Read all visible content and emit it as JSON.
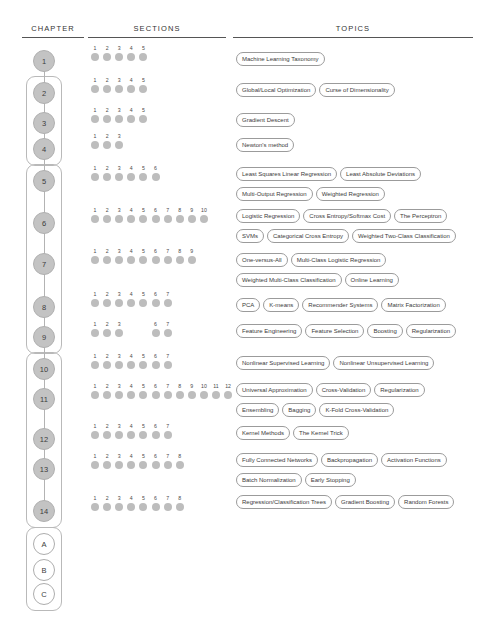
{
  "headers": {
    "chapter": "CHAPTER",
    "sections": "SECTIONS",
    "topics": "TOPICS"
  },
  "colors": {
    "node_fill": "#c3c3c3",
    "node_border": "#b0b0b0",
    "dot": "#bdbdbd",
    "pill_border": "#9b9b9b",
    "group_border": "#b9b9b9",
    "link": "#b3b3b3",
    "text": "#3a3a3a"
  },
  "groups": [
    {
      "name": "group-chapters-2-4",
      "from": 2,
      "to": 4
    },
    {
      "name": "group-chapters-5-9",
      "from": 5,
      "to": 9
    },
    {
      "name": "group-chapters-10-14",
      "from": 10,
      "to": 14
    },
    {
      "name": "group-appendices-a-c",
      "from": "A",
      "to": "C"
    }
  ],
  "chapters": [
    {
      "label": "1",
      "y": 50,
      "appendix": false
    },
    {
      "label": "2",
      "y": 82,
      "appendix": false
    },
    {
      "label": "3",
      "y": 112,
      "appendix": false
    },
    {
      "label": "4",
      "y": 138,
      "appendix": false
    },
    {
      "label": "5",
      "y": 170,
      "appendix": false
    },
    {
      "label": "6",
      "y": 212,
      "appendix": false
    },
    {
      "label": "7",
      "y": 253,
      "appendix": false
    },
    {
      "label": "8",
      "y": 296,
      "appendix": false
    },
    {
      "label": "9",
      "y": 326,
      "appendix": false
    },
    {
      "label": "10",
      "y": 358,
      "appendix": false
    },
    {
      "label": "11",
      "y": 388,
      "appendix": false
    },
    {
      "label": "12",
      "y": 428,
      "appendix": false
    },
    {
      "label": "13",
      "y": 458,
      "appendix": false
    },
    {
      "label": "14",
      "y": 500,
      "appendix": false
    },
    {
      "label": "A",
      "y": 533,
      "appendix": true
    },
    {
      "label": "B",
      "y": 559,
      "appendix": true
    },
    {
      "label": "C",
      "y": 583,
      "appendix": true
    }
  ],
  "sections": [
    {
      "chapter": "1",
      "y": 45,
      "numbers": [
        "1",
        "2",
        "3",
        "4",
        "5"
      ]
    },
    {
      "chapter": "2",
      "y": 77,
      "numbers": [
        "1",
        "2",
        "3",
        "4",
        "5"
      ]
    },
    {
      "chapter": "3",
      "y": 107,
      "numbers": [
        "1",
        "2",
        "3",
        "4",
        "5"
      ]
    },
    {
      "chapter": "4",
      "y": 133,
      "numbers": [
        "1",
        "2",
        "3"
      ]
    },
    {
      "chapter": "5",
      "y": 165,
      "numbers": [
        "1",
        "2",
        "3",
        "4",
        "5",
        "6"
      ]
    },
    {
      "chapter": "6",
      "y": 207,
      "numbers": [
        "1",
        "2",
        "3",
        "4",
        "5",
        "6",
        "7",
        "8",
        "9",
        "10"
      ]
    },
    {
      "chapter": "7",
      "y": 248,
      "numbers": [
        "1",
        "2",
        "3",
        "4",
        "5",
        "6",
        "7",
        "8",
        "9"
      ]
    },
    {
      "chapter": "8",
      "y": 291,
      "numbers": [
        "1",
        "2",
        "3",
        "4",
        "5",
        "6",
        "7"
      ]
    },
    {
      "chapter": "9",
      "y": 321,
      "numbers": [
        "1",
        "2",
        "3",
        "",
        "",
        "6",
        "7"
      ]
    },
    {
      "chapter": "10",
      "y": 353,
      "numbers": [
        "1",
        "2",
        "3",
        "4",
        "5",
        "6",
        "7"
      ]
    },
    {
      "chapter": "11",
      "y": 383,
      "numbers": [
        "1",
        "2",
        "3",
        "4",
        "5",
        "6",
        "7",
        "8",
        "9",
        "10",
        "11",
        "12"
      ]
    },
    {
      "chapter": "12",
      "y": 423,
      "numbers": [
        "1",
        "2",
        "3",
        "4",
        "5",
        "6",
        "7"
      ]
    },
    {
      "chapter": "13",
      "y": 453,
      "numbers": [
        "1",
        "2",
        "3",
        "4",
        "5",
        "6",
        "7",
        "8"
      ]
    },
    {
      "chapter": "14",
      "y": 495,
      "numbers": [
        "1",
        "2",
        "3",
        "4",
        "5",
        "6",
        "7",
        "8"
      ]
    }
  ],
  "topics": [
    {
      "chapter": "1",
      "y": 49,
      "lines": [
        [
          "Machine Learning Taxonomy"
        ]
      ]
    },
    {
      "chapter": "2",
      "y": 80,
      "lines": [
        [
          "Global/Local Optimization",
          "Curse of Dimensionality"
        ]
      ]
    },
    {
      "chapter": "3",
      "y": 110,
      "lines": [
        [
          "Gradient Descent"
        ]
      ]
    },
    {
      "chapter": "4",
      "y": 135,
      "lines": [
        [
          "Newton's method"
        ]
      ]
    },
    {
      "chapter": "5",
      "y": 164,
      "lines": [
        [
          "Least Squares Linear Regression",
          "Least Absolute Deviations"
        ],
        [
          "Multi-Output Regression",
          "Weighted Regression"
        ]
      ]
    },
    {
      "chapter": "6",
      "y": 206,
      "lines": [
        [
          "Logistic Regression",
          "Cross Entropy/Softmax Cost",
          "The Perceptron"
        ],
        [
          "SVMs",
          "Categorical Cross Entropy",
          "Weighted Two-Class Classification"
        ]
      ]
    },
    {
      "chapter": "7",
      "y": 250,
      "lines": [
        [
          "One-versus-All",
          "Multi-Class Logistic Regression"
        ],
        [
          "Weighted Multi-Class Classification",
          "Online Learning"
        ]
      ]
    },
    {
      "chapter": "8",
      "y": 295,
      "lines": [
        [
          "PCA",
          "K-means",
          "Recommender Systems",
          "Matrix Factorization"
        ]
      ]
    },
    {
      "chapter": "9",
      "y": 321,
      "lines": [
        [
          "Feature Engineering",
          "Feature Selection",
          "Boosting",
          "Regularization"
        ]
      ]
    },
    {
      "chapter": "10",
      "y": 353,
      "lines": [
        [
          "Nonlinear Supervised Learning",
          "Nonlinear Unsupervised Learning"
        ]
      ]
    },
    {
      "chapter": "11",
      "y": 380,
      "lines": [
        [
          "Universal Approximation",
          "Cross-Validation",
          "Regularization"
        ],
        [
          "Ensembling",
          "Bagging",
          "K-Fold Cross-Validation"
        ]
      ]
    },
    {
      "chapter": "12",
      "y": 423,
      "lines": [
        [
          "Kernel Methods",
          "The Kernel Trick"
        ]
      ]
    },
    {
      "chapter": "13",
      "y": 450,
      "lines": [
        [
          "Fully Connected Networks",
          "Backpropagation",
          "Activation Functions"
        ],
        [
          "Batch Normalization",
          "Early Stopping"
        ]
      ]
    },
    {
      "chapter": "14",
      "y": 492,
      "lines": [
        [
          "Regression/Classification Trees",
          "Gradient Boosting",
          "Random Forests"
        ]
      ]
    }
  ]
}
